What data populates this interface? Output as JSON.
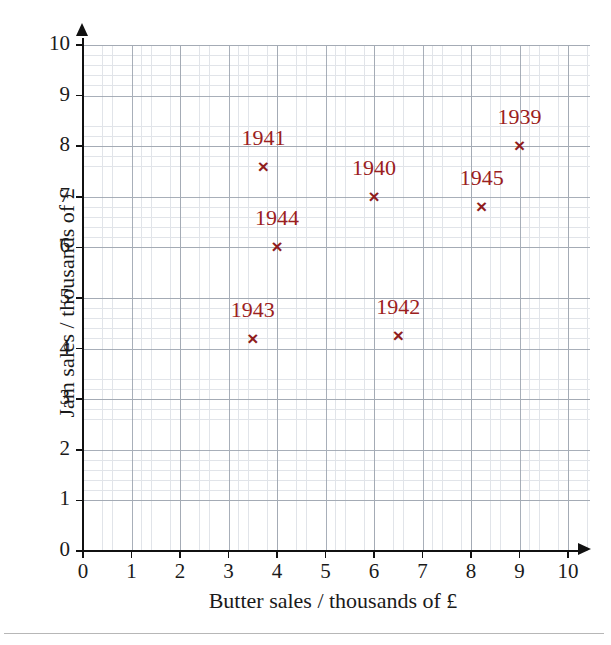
{
  "chart_data": {
    "type": "scatter",
    "title": "",
    "xlabel": "Butter sales / thousands of £",
    "ylabel": "Jam sales / thousands of £",
    "xlim": [
      0,
      10
    ],
    "ylim": [
      0,
      10
    ],
    "x_ticks": [
      "0",
      "1",
      "2",
      "3",
      "4",
      "5",
      "6",
      "7",
      "8",
      "9",
      "10"
    ],
    "y_ticks": [
      "0",
      "1",
      "2",
      "3",
      "4",
      "5",
      "6",
      "7",
      "8",
      "9",
      "10"
    ],
    "grid": true,
    "grid_major_step": 1,
    "grid_minor_subdivisions": 5,
    "legend": "none",
    "marker": "x",
    "marker_color": "#8f1d1d",
    "label_color": "#9b2020",
    "points": [
      {
        "label": "1939",
        "x": 9.0,
        "y": 8.0
      },
      {
        "label": "1940",
        "x": 6.0,
        "y": 7.0
      },
      {
        "label": "1941",
        "x": 3.72,
        "y": 7.58
      },
      {
        "label": "1942",
        "x": 6.5,
        "y": 4.25
      },
      {
        "label": "1943",
        "x": 3.5,
        "y": 4.18
      },
      {
        "label": "1944",
        "x": 4.0,
        "y": 6.0
      },
      {
        "label": "1945",
        "x": 8.22,
        "y": 6.8
      }
    ]
  },
  "axes": {
    "x_title": "Butter sales / thousands of £",
    "y_title": "Jam sales / thousands of £"
  }
}
